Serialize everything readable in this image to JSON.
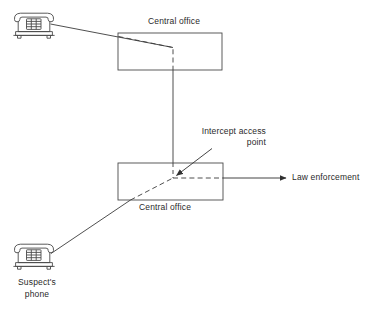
{
  "diagram": {
    "background_color": "#ffffff",
    "stroke_color": "#404040",
    "text_color": "#2a2a2a",
    "labels": {
      "central_office_top": "Central office",
      "central_office_bottom": "Central office",
      "intercept_access_point_line1": "Intercept access",
      "intercept_access_point_line2": "point",
      "law_enforcement": "Law enforcement",
      "suspects_phone_line1": "Suspect's",
      "suspects_phone_line2": "phone"
    },
    "nodes": [
      {
        "name": "top-phone",
        "icon": "desk-telephone-icon",
        "x": 10,
        "y": 12,
        "width": 48,
        "height": 30
      },
      {
        "name": "central-office-top-box",
        "shape": "rectangle",
        "x": 118,
        "y": 33,
        "width": 104,
        "height": 37
      },
      {
        "name": "central-office-bottom-box",
        "shape": "rectangle",
        "x": 118,
        "y": 163,
        "width": 105,
        "height": 37
      },
      {
        "name": "suspects-phone",
        "icon": "desk-telephone-icon",
        "x": 10,
        "y": 243,
        "width": 48,
        "height": 30
      },
      {
        "name": "intercept-access-junction",
        "shape": "point",
        "x": 173,
        "y": 178
      }
    ],
    "connections": [
      {
        "name": "top-phone-to-central-office",
        "style": "solid",
        "from": "top-phone",
        "to": "central-office-top-box"
      },
      {
        "name": "tapped-path-inside-top-office",
        "style": "dashed",
        "from": "central-office-top-box-left-edge",
        "to": "vertical-trunk"
      },
      {
        "name": "vertical-trunk-between-offices",
        "style": "solid",
        "from": "central-office-top-box",
        "to": "central-office-bottom-box"
      },
      {
        "name": "suspects-phone-to-central-office",
        "style": "solid",
        "from": "suspects-phone",
        "to": "central-office-bottom-box"
      },
      {
        "name": "tapped-path-inside-bottom-office",
        "style": "dashed",
        "from": "suspects-phone-line",
        "to": "intercept-access-junction"
      },
      {
        "name": "intercept-feed-dashed",
        "style": "dashed",
        "from": "intercept-access-junction",
        "to": "central-office-bottom-box-right-edge"
      },
      {
        "name": "law-enforcement-delivery",
        "style": "solid-arrow",
        "from": "central-office-bottom-box-right-edge",
        "to": "law-enforcement"
      },
      {
        "name": "intercept-access-point-pointer",
        "style": "solid-arrow",
        "from": "intercept-access-point-label",
        "to": "intercept-access-junction"
      }
    ]
  }
}
